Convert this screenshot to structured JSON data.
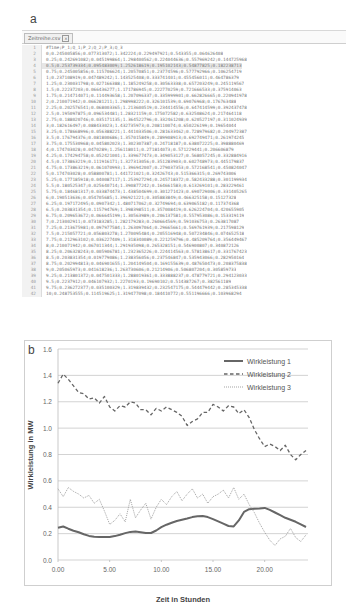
{
  "panels": {
    "a": "a",
    "b": "b"
  },
  "editor": {
    "tab_label": "Zeitreihe.csv",
    "tab_close_icon": "×",
    "active_line": 4,
    "lines": [
      "#Time;P_1;Q_1;P_2;Q_2;P_3;Q_3",
      "0;0.245005856;0.077313072;1.342224;0.229497921;0.543355;0.064626408",
      "0.25;0.242691082;0.045199864;1.298400562;0.224044636;0.557969242;0.144725968",
      "0.5;0.253739334;0.095483009;1.252618619;0.195102143;0.54877825;0.182238713",
      "0.75;0.245005856;0.115706624;1.20570851;0.23774596;0.577792966;0.106254719",
      "1;0.237108919;0.047489242;1.143525408;0.333741401;0.455456011;0.464786379",
      "1.25;0.230031798;0.027166388;1.185249258;0.30563338;0.657203249;0.245119567",
      "1.5;0.22237203;0.066436277;1.171786945;0.222770259;0.721666533;0.375914063",
      "1.75;0.214714071;0.114493658;1.207096337;0.335999901;0.662826665;0.220941978",
      "2;0.210071942;0.066281211;1.298998222;0.326101539;0.69076968;0.176763488",
      "2.25;0.202576541;0.068003365;1.213600519;0.234414556;0.647414599;0.392437478",
      "2.5;0.195097875;0.096534481;1.28321159;0.175072582;0.632508624;0.217464118",
      "2.75;0.188020746;0.035171135;1.364522796;0.332461208;0.620527197;0.311024939",
      "3;0.182616497;0.088433023;1.432735973;0.208110074;0.650226199;0.19654044",
      "3.25;0.178668996;0.056388221;1.441033506;0.281633462;0.728979682;0.204972387",
      "3.5;0.176794376;0.081800686;1.357015849;0.289908913;0.692749471;0.261974245",
      "3.75;0.175530968;0.045802023;1.302307387;0.24718187;0.638072225;0.398880469",
      "4;0.174703028;0.0470289;1.256118011;0.271814073;0.571229441;0.206606879",
      "4.25;0.174294758;0.052421001;1.339677473;0.349053127;0.568057245;0.332884916",
      "4.5;0.173863219;0.111916171;1.327313056;0.351283903;0.602748973;0.445179837",
      "4.75;0.173863219;0.061070993;1.396942007;0.279037353;0.572168541;0.450824047",
      "5;0.174703028;0.058800781;1.441721021;0.32426743;0.515366315;0.269743006",
      "5.25;0.177185918;0.040087117;1.253927294;0.245718372;0.582433288;0.301199934",
      "5.5;0.180525347;0.025640714;1.390877242;0.164661583;0.613269101;0.283229461",
      "5.75;0.184681317;0.033874473;1.438504699;0.301271423;0.690729006;0.331405265",
      "6;0.190513636;0.054705685;1.396921221;0.305883849;0.466325158;0.15127328",
      "6.25;0.197172495;0.0907342;1.480717062;0.32749694;0.639065182;0.117374368",
      "6.5;0.203831354;0.115794769;1.398398511;0.357008419;0.626224704;0.420655905",
      "6.75;0.209653672;0.066645199;1.30563989;0.206137581;0.557953086;0.153319119",
      "7;0.213002911;0.073183285;1.282179283;0.260664569;0.591036753;0.263817087",
      "7.25;0.213675981;0.097977584;1.263097064;0.29665661;0.569761939;0.217598129",
      "7.5;0.215057721;0.056803278;1.270095484;0.205516948;0.507234846;0.074652518",
      "7.75;0.212963102;0.036227409;1.318340089;0.221259796;0.485209764;0.356449467",
      "8;0.210071942;0.067011344;1.291935098;0.265328151;0.546900807;0.340872126",
      "8.25;0.206328243;0.005906781;1.232365226;0.224414563;0.578138617;0.331767423",
      "8.5;0.203831354;0.019779086;1.238356056;0.237546847;0.535943066;0.282950164",
      "8.75;0.202994813;0.046901655;1.204149504;0.169155639;0.487650473;0.208375838",
      "9;0.205065973;0.041618236;1.263730606;0.21214906;0.506807204;0.305859733",
      "9.25;0.213801372;0.047501333;1.288019361;0.333888237;0.478779721;0.294123033",
      "9.5;0.2237912;0.046107932;1.2270193;0.19690102;0.514387267;0.382561189",
      "9.75;0.236272377;0.035100329;1.319839432;0.232547175;0.544479442;0.285345338",
      "10;0.248753555;0.114519625;1.319477098;0.184410772;0.551196666;0.103968294"
    ]
  },
  "chart_data": {
    "type": "line",
    "title": "",
    "xlabel": "Zeit in Stunden",
    "ylabel": "Wirkleistung in MW",
    "xlim": [
      0,
      24
    ],
    "ylim": [
      0,
      1.6
    ],
    "xticks": [
      "0.00",
      "5.00",
      "10.00",
      "15.00",
      "20.00"
    ],
    "yticks": [
      "0.0",
      "0.2",
      "0.4",
      "0.6",
      "0.8",
      "1.0",
      "1.2",
      "1.4",
      "1.6"
    ],
    "grid": "horizontal",
    "legend_position": "top-right",
    "x": [
      0,
      0.5,
      1,
      1.5,
      2,
      2.5,
      3,
      3.5,
      4,
      4.5,
      5,
      5.5,
      6,
      6.5,
      7,
      7.5,
      8,
      8.5,
      9,
      9.5,
      10,
      10.5,
      11,
      11.5,
      12,
      12.5,
      13,
      13.5,
      14,
      14.5,
      15,
      15.5,
      16,
      16.5,
      17,
      17.5,
      18,
      18.5,
      19,
      19.5,
      20,
      20.5,
      21,
      21.5,
      22,
      22.5,
      23,
      23.5,
      24
    ],
    "series": [
      {
        "name": "Wirkleistung 1",
        "style": "solid",
        "color": "#666666",
        "values": [
          0.245,
          0.254,
          0.237,
          0.222,
          0.21,
          0.195,
          0.183,
          0.177,
          0.175,
          0.174,
          0.175,
          0.181,
          0.191,
          0.204,
          0.213,
          0.215,
          0.21,
          0.204,
          0.205,
          0.224,
          0.249,
          0.268,
          0.283,
          0.296,
          0.305,
          0.315,
          0.325,
          0.332,
          0.333,
          0.325,
          0.31,
          0.293,
          0.275,
          0.258,
          0.255,
          0.3,
          0.365,
          0.385,
          0.388,
          0.39,
          0.395,
          0.38,
          0.36,
          0.34,
          0.32,
          0.305,
          0.29,
          0.27,
          0.25
        ]
      },
      {
        "name": "Wirkleistung 2",
        "style": "dashed",
        "color": "#666666",
        "values": [
          1.34,
          1.41,
          1.37,
          1.32,
          1.27,
          1.26,
          1.22,
          1.23,
          1.19,
          1.24,
          1.16,
          1.13,
          1.17,
          1.16,
          1.2,
          1.19,
          1.14,
          1.14,
          1.1,
          1.15,
          1.13,
          1.16,
          1.14,
          1.12,
          1.09,
          1.02,
          1.05,
          1.07,
          1.12,
          1.12,
          1.18,
          1.16,
          1.13,
          1.17,
          1.16,
          1.11,
          1.14,
          1.08,
          0.99,
          0.92,
          0.86,
          0.88,
          0.86,
          0.83,
          0.87,
          0.8,
          0.76,
          0.8,
          0.83
        ]
      },
      {
        "name": "Wirkleistung 3",
        "style": "dotted",
        "color": "#999999",
        "values": [
          0.54,
          0.48,
          0.55,
          0.52,
          0.5,
          0.47,
          0.49,
          0.43,
          0.46,
          0.37,
          0.27,
          0.3,
          0.35,
          0.29,
          0.46,
          0.32,
          0.38,
          0.43,
          0.31,
          0.4,
          0.46,
          0.42,
          0.48,
          0.52,
          0.45,
          0.5,
          0.54,
          0.47,
          0.5,
          0.43,
          0.48,
          0.5,
          0.53,
          0.47,
          0.55,
          0.46,
          0.5,
          0.42,
          0.36,
          0.28,
          0.21,
          0.15,
          0.11,
          0.16,
          0.18,
          0.24,
          0.17,
          0.14,
          0.19
        ]
      }
    ]
  }
}
